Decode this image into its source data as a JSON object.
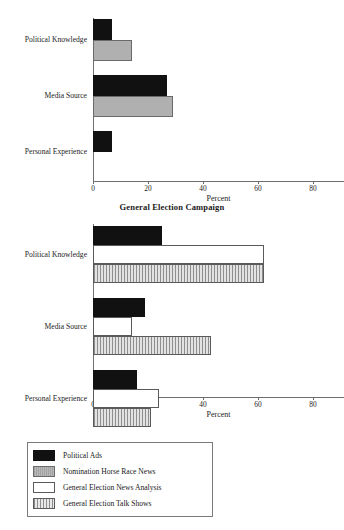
{
  "figure": {
    "top_title_clipped": "Nomination Campaign",
    "bottom_title": "General Election Campaign"
  },
  "legend": {
    "items": [
      {
        "label": "Political Ads",
        "pattern": "black",
        "color": "#111111"
      },
      {
        "label": "Nomination Horse Race News",
        "pattern": "gray",
        "color": "#b0b0b0"
      },
      {
        "label": "General Election News Analysis",
        "pattern": "white",
        "color": "#ffffff"
      },
      {
        "label": "General Election Talk Shows",
        "pattern": "hatch",
        "color": "#cfcfcf"
      }
    ]
  },
  "chart_data": [
    {
      "type": "bar",
      "orientation": "horizontal",
      "title": "Nomination Campaign",
      "xlabel": "Percent",
      "ylabel": "",
      "xlim": [
        0,
        80
      ],
      "xticks": [
        0,
        20,
        40,
        60,
        80
      ],
      "grid": false,
      "legend_position": "figure-bottom-left",
      "categories": [
        "Political Knowledge",
        "Media Source",
        "Personal Experience"
      ],
      "series": [
        {
          "name": "Political Ads",
          "pattern": "black",
          "values": [
            7,
            27,
            7
          ]
        },
        {
          "name": "Nomination Horse Race News",
          "pattern": "gray",
          "values": [
            14,
            29,
            0
          ]
        }
      ]
    },
    {
      "type": "bar",
      "orientation": "horizontal",
      "title": "General Election Campaign",
      "xlabel": "Percent",
      "ylabel": "",
      "xlim": [
        0,
        80
      ],
      "xticks": [
        0,
        20,
        40,
        60,
        80
      ],
      "grid": false,
      "legend_position": "figure-bottom-left",
      "categories": [
        "Political Knowledge",
        "Media Source",
        "Personal Experience"
      ],
      "series": [
        {
          "name": "Political Ads",
          "pattern": "black",
          "values": [
            25,
            19,
            16
          ]
        },
        {
          "name": "General Election News Analysis",
          "pattern": "white",
          "values": [
            62,
            14,
            24
          ]
        },
        {
          "name": "General Election Talk Shows",
          "pattern": "hatch",
          "values": [
            62,
            43,
            21
          ]
        }
      ]
    }
  ]
}
